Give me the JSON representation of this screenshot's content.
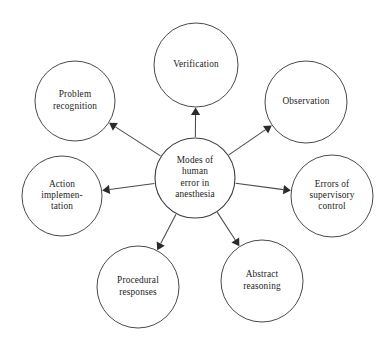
{
  "diagram": {
    "type": "hub-and-spoke",
    "canvas": {
      "width": 391,
      "height": 347,
      "background": "#ffffff"
    },
    "style": {
      "node_fill": "#ffffff",
      "node_stroke": "#4a4a4a",
      "edge_stroke": "#4a4a4a",
      "arrow_fill": "#2b2b2b",
      "text_color": "#1c1c1c"
    },
    "center": {
      "id": "center",
      "name": "modes-of-human-error-in-anesthesia",
      "label": "Modes of human error in anesthesia",
      "lines": [
        "Modes of",
        "human",
        "error in",
        "anesthesia"
      ],
      "cx": 195,
      "cy": 178,
      "r": 40
    },
    "nodes": [
      {
        "id": "verification",
        "name": "verification",
        "label": "Verification",
        "lines": [
          "Verification"
        ],
        "cx": 196,
        "cy": 65,
        "r": 42,
        "position": "top"
      },
      {
        "id": "observation",
        "name": "observation",
        "label": "Observation",
        "lines": [
          "Observation"
        ],
        "cx": 306,
        "cy": 102,
        "r": 41,
        "position": "top-right"
      },
      {
        "id": "errors-of-supervisory-control",
        "name": "errors-of-supervisory-control",
        "label": "Errors of supervisory control",
        "lines": [
          "Errors of",
          "supervisory",
          "control"
        ],
        "cx": 332,
        "cy": 196,
        "r": 41,
        "position": "right"
      },
      {
        "id": "abstract-reasoning",
        "name": "abstract-reasoning",
        "label": "Abstract reasoning",
        "lines": [
          "Abstract",
          "reasoning"
        ],
        "cx": 262,
        "cy": 281,
        "r": 41,
        "position": "bottom-right"
      },
      {
        "id": "procedural-responses",
        "name": "procedural-responses",
        "label": "Procedural responses",
        "lines": [
          "Procedural",
          "responses"
        ],
        "cx": 138,
        "cy": 287,
        "r": 41,
        "position": "bottom-left"
      },
      {
        "id": "action-implementation",
        "name": "action-implementation",
        "label": "Action implementation",
        "lines": [
          "Action",
          "implemen-",
          "tation"
        ],
        "cx": 62,
        "cy": 196,
        "r": 40,
        "position": "left"
      },
      {
        "id": "problem-recognition",
        "name": "problem-recognition",
        "label": "Problem recognition",
        "lines": [
          "Problem",
          "recognition"
        ],
        "cx": 75,
        "cy": 101,
        "r": 40,
        "position": "top-left"
      }
    ],
    "edges": [
      {
        "from": "center",
        "to": "verification",
        "arrow": "to"
      },
      {
        "from": "center",
        "to": "observation",
        "arrow": "to"
      },
      {
        "from": "center",
        "to": "errors-of-supervisory-control",
        "arrow": "to"
      },
      {
        "from": "center",
        "to": "abstract-reasoning",
        "arrow": "to"
      },
      {
        "from": "center",
        "to": "procedural-responses",
        "arrow": "to"
      },
      {
        "from": "center",
        "to": "action-implementation",
        "arrow": "to"
      },
      {
        "from": "center",
        "to": "problem-recognition",
        "arrow": "to"
      }
    ]
  }
}
